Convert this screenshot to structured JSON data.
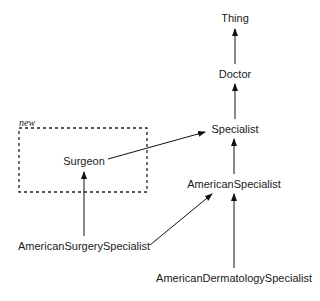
{
  "diagram": {
    "group_label": "new",
    "nodes": [
      {
        "id": "thing",
        "label": "Thing"
      },
      {
        "id": "doctor",
        "label": "Doctor"
      },
      {
        "id": "specialist",
        "label": "Specialist"
      },
      {
        "id": "american_specialist",
        "label": "AmericanSpecialist"
      },
      {
        "id": "american_dermatology_specialist",
        "label": "AmericanDermatologySpecialist"
      },
      {
        "id": "american_surgery_specialist",
        "label": "AmericanSurgerySpecialist"
      },
      {
        "id": "surgeon",
        "label": "Surgeon"
      }
    ],
    "edges": [
      {
        "from": "doctor",
        "to": "thing"
      },
      {
        "from": "specialist",
        "to": "doctor"
      },
      {
        "from": "american_specialist",
        "to": "specialist"
      },
      {
        "from": "american_dermatology_specialist",
        "to": "american_specialist"
      },
      {
        "from": "american_surgery_specialist",
        "to": "american_specialist"
      },
      {
        "from": "american_surgery_specialist",
        "to": "surgeon"
      },
      {
        "from": "surgeon",
        "to": "specialist"
      }
    ]
  }
}
